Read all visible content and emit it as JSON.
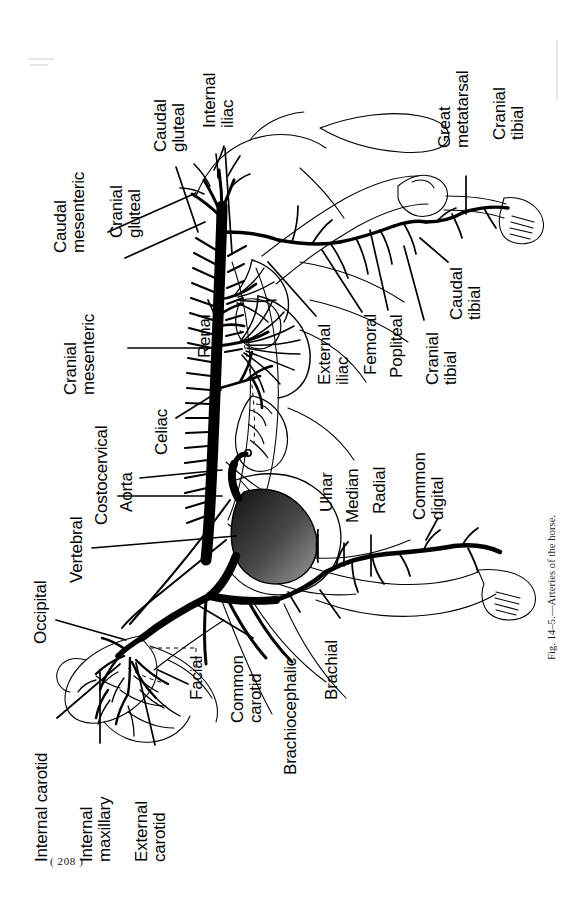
{
  "page": {
    "width": 586,
    "height": 923,
    "background": "#ffffff",
    "ink_color": "#000000",
    "page_number": "( 208 )",
    "caption": "Fig. 14–5.—Arteries of the horse."
  },
  "figure": {
    "title": "Arteries of the horse",
    "figure_number": "Fig. 14-5.",
    "orientation": "rotated-90-counterclockwise",
    "subject": "horse",
    "view": "whole-body lateral arterial schematic"
  },
  "labels": [
    {
      "id": "caudal-mesenteric",
      "text": "Caudal\nmesenteric",
      "x": 52,
      "y": 253,
      "lines": [
        "Caudal",
        "mesenteric"
      ]
    },
    {
      "id": "caudal-gluteal",
      "text": "Caudal\ngluteal",
      "x": 152,
      "y": 152,
      "lines": [
        "Caudal",
        "gluteal"
      ]
    },
    {
      "id": "cranial-gluteal",
      "text": "Cranial\ngluteal",
      "x": 108,
      "y": 238,
      "lines": [
        "Cranial",
        "gluteal"
      ]
    },
    {
      "id": "internal-iliac",
      "text": "Internal\niliac",
      "x": 201,
      "y": 128,
      "lines": [
        "Internal",
        "iliac"
      ]
    },
    {
      "id": "cranial-mesenteric",
      "text": "Cranial\nmesenteric",
      "x": 62,
      "y": 395,
      "lines": [
        "Cranial",
        "mesenteric"
      ]
    },
    {
      "id": "renal",
      "text": "Renal",
      "x": 196,
      "y": 358,
      "lines": [
        "Renal"
      ]
    },
    {
      "id": "celiac",
      "text": "Celiac",
      "x": 153,
      "y": 455,
      "lines": [
        "Celiac"
      ]
    },
    {
      "id": "costocervical",
      "text": "Costocervical",
      "x": 93,
      "y": 525,
      "lines": [
        "Costocervical"
      ]
    },
    {
      "id": "aorta",
      "text": "Aorta",
      "x": 118,
      "y": 512,
      "lines": [
        "Aorta"
      ]
    },
    {
      "id": "vertebral",
      "text": "Vertebral",
      "x": 68,
      "y": 583,
      "lines": [
        "Vertebral"
      ]
    },
    {
      "id": "occipital",
      "text": "Occipital",
      "x": 32,
      "y": 644,
      "lines": [
        "Occipital"
      ]
    },
    {
      "id": "internal-carotid",
      "text": "Internal carotid",
      "x": 33,
      "y": 862,
      "lines": [
        "Internal carotid"
      ]
    },
    {
      "id": "internal-maxillary",
      "text": "Internal\nmaxillary",
      "x": 78,
      "y": 862,
      "lines": [
        "Internal",
        "maxillary"
      ]
    },
    {
      "id": "external-carotid",
      "text": "External\ncarotid",
      "x": 133,
      "y": 862,
      "lines": [
        "External",
        "carotid"
      ]
    },
    {
      "id": "facial",
      "text": "Facial",
      "x": 188,
      "y": 700,
      "lines": [
        "Facial"
      ]
    },
    {
      "id": "common-carotid",
      "text": "Common\ncarotid",
      "x": 229,
      "y": 723,
      "lines": [
        "Common",
        "carotid"
      ]
    },
    {
      "id": "brachiocephalic",
      "text": "Brachiocephalic",
      "x": 282,
      "y": 775,
      "lines": [
        "Brachiocephalic"
      ]
    },
    {
      "id": "brachial",
      "text": "Brachial",
      "x": 323,
      "y": 700,
      "lines": [
        "Brachial"
      ]
    },
    {
      "id": "ulnar",
      "text": "Ulnar",
      "x": 318,
      "y": 512,
      "lines": [
        "Ulnar"
      ]
    },
    {
      "id": "median",
      "text": "Median",
      "x": 344,
      "y": 523,
      "lines": [
        "Median"
      ]
    },
    {
      "id": "radial",
      "text": "Radial",
      "x": 371,
      "y": 514,
      "lines": [
        "Radial"
      ]
    },
    {
      "id": "common-digital",
      "text": "Common\ndigital",
      "x": 411,
      "y": 520,
      "lines": [
        "Common",
        "digital"
      ]
    },
    {
      "id": "external-iliac",
      "text": "External\niliac",
      "x": 316,
      "y": 385,
      "lines": [
        "External",
        "iliac"
      ]
    },
    {
      "id": "femoral",
      "text": "Femoral",
      "x": 362,
      "y": 375,
      "lines": [
        "Femoral"
      ]
    },
    {
      "id": "popliteal",
      "text": "Popliteal",
      "x": 388,
      "y": 378,
      "lines": [
        "Popliteal"
      ]
    },
    {
      "id": "cranial-tibial-upper",
      "text": "Cranial\ntibial",
      "x": 424,
      "y": 385,
      "lines": [
        "Cranial",
        "tibial"
      ]
    },
    {
      "id": "caudal-tibial",
      "text": "Caudal\ntibial",
      "x": 448,
      "y": 320,
      "lines": [
        "Caudal",
        "tibial"
      ]
    },
    {
      "id": "great-metatarsal",
      "text": "Great\nmetatarsal",
      "x": 436,
      "y": 148,
      "lines": [
        "Great",
        "metatarsal"
      ]
    },
    {
      "id": "cranial-tibial-lower",
      "text": "Cranial\ntibial",
      "x": 491,
      "y": 140,
      "lines": [
        "Cranial",
        "tibial"
      ]
    }
  ],
  "leader_lines": [
    {
      "from": "caudal-mesenteric",
      "x1": 108,
      "y1": 232,
      "x2": 196,
      "y2": 193
    },
    {
      "from": "caudal-gluteal",
      "x1": 176,
      "y1": 167,
      "x2": 198,
      "y2": 232
    },
    {
      "from": "cranial-gluteal",
      "x1": 125,
      "y1": 258,
      "x2": 205,
      "y2": 222
    },
    {
      "from": "internal-iliac",
      "x1": 225,
      "y1": 148,
      "x2": 232,
      "y2": 254
    },
    {
      "from": "cranial-mesenteric",
      "x1": 128,
      "y1": 348,
      "x2": 216,
      "y2": 348
    },
    {
      "from": "renal",
      "x1": 208,
      "y1": 300,
      "x2": 216,
      "y2": 318
    },
    {
      "from": "celiac",
      "x1": 176,
      "y1": 418,
      "x2": 221,
      "y2": 390
    },
    {
      "from": "costocervical",
      "x1": 118,
      "y1": 496,
      "x2": 222,
      "y2": 496
    },
    {
      "from": "aorta",
      "x1": 140,
      "y1": 478,
      "x2": 222,
      "y2": 470
    },
    {
      "from": "vertebral",
      "x1": 92,
      "y1": 548,
      "x2": 236,
      "y2": 536
    },
    {
      "from": "occipital",
      "x1": 56,
      "y1": 620,
      "x2": 126,
      "y2": 640
    },
    {
      "from": "internal-carotid",
      "x1": 57,
      "y1": 718,
      "x2": 120,
      "y2": 664
    },
    {
      "from": "internal-maxillary",
      "x1": 100,
      "y1": 743,
      "x2": 100,
      "y2": 672
    },
    {
      "from": "external-carotid",
      "x1": 155,
      "y1": 745,
      "x2": 136,
      "y2": 663
    },
    {
      "from": "facial",
      "x1": 188,
      "y1": 684,
      "x2": 158,
      "y2": 670
    },
    {
      "from": "common-carotid",
      "x1": 253,
      "y1": 638,
      "x2": 196,
      "y2": 604
    },
    {
      "from": "brachiocephalic",
      "x1": 300,
      "y1": 612,
      "x2": 288,
      "y2": 592
    },
    {
      "from": "brachial",
      "x1": 340,
      "y1": 618,
      "x2": 320,
      "y2": 590
    },
    {
      "from": "ulnar",
      "x1": 318,
      "y1": 534,
      "x2": 318,
      "y2": 556
    },
    {
      "from": "median",
      "x1": 344,
      "y1": 543,
      "x2": 344,
      "y2": 565
    },
    {
      "from": "radial",
      "x1": 371,
      "y1": 535,
      "x2": 371,
      "y2": 575
    },
    {
      "from": "common-digital",
      "x1": 426,
      "y1": 540,
      "x2": 438,
      "y2": 516
    },
    {
      "from": "external-iliac",
      "x1": 316,
      "y1": 316,
      "x2": 268,
      "y2": 262
    },
    {
      "from": "femoral",
      "x1": 362,
      "y1": 312,
      "x2": 322,
      "y2": 250
    },
    {
      "from": "popliteal",
      "x1": 388,
      "y1": 310,
      "x2": 370,
      "y2": 228
    },
    {
      "from": "cranial-tibial-upper",
      "x1": 424,
      "y1": 320,
      "x2": 404,
      "y2": 246
    },
    {
      "from": "caudal-tibial",
      "x1": 448,
      "y1": 262,
      "x2": 420,
      "y2": 238
    },
    {
      "from": "great-metatarsal",
      "x1": 466,
      "y1": 176,
      "x2": 466,
      "y2": 214
    }
  ],
  "colors": {
    "ink": "#000000",
    "paper": "#ffffff",
    "heart_shade": "#3a3a3a",
    "light_line": "#2b2b2b"
  }
}
